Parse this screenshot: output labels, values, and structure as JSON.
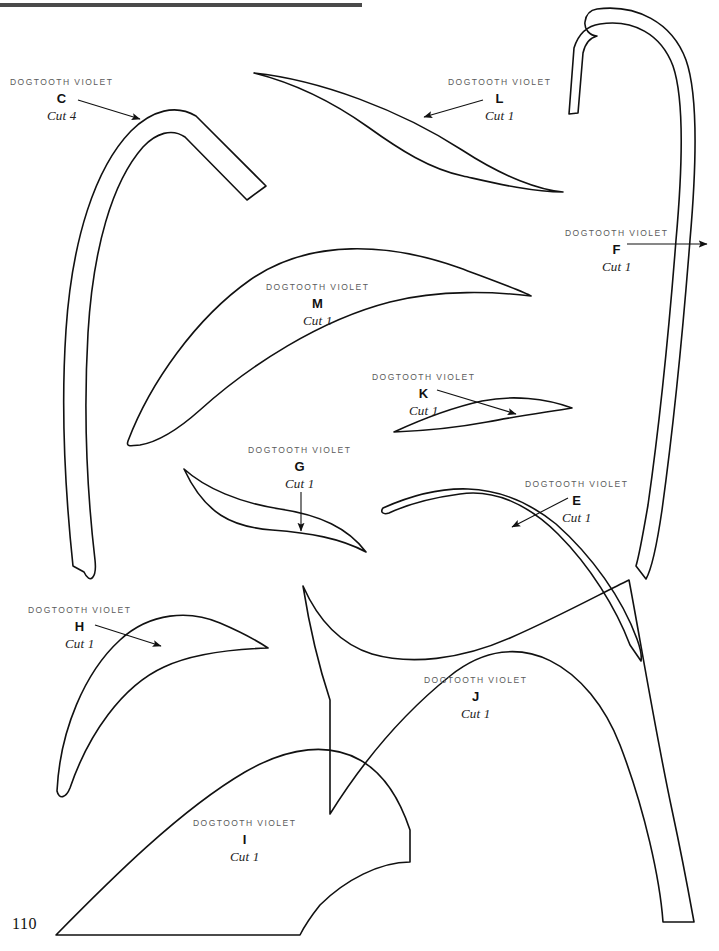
{
  "page": {
    "number": "110",
    "rule": {
      "color": "#4a4a4a"
    },
    "ink_color": "#111111",
    "title_color": "#5b5b5b"
  },
  "pieces": [
    {
      "id": "C",
      "title": "DOGTOOTH VIOLET",
      "letter": "C",
      "cut": "Cut 4",
      "label_x": 10,
      "label_y": 78,
      "arrow": {
        "from_x": 78,
        "from_y": 100,
        "to_x": 140,
        "to_y": 119
      }
    },
    {
      "id": "L",
      "title": "DOGTOOTH VIOLET",
      "letter": "L",
      "cut": "Cut 1",
      "label_x": 448,
      "label_y": 78,
      "arrow": {
        "from_x": 483,
        "from_y": 100,
        "to_x": 423,
        "to_y": 117
      }
    },
    {
      "id": "F",
      "title": "DOGTOOTH VIOLET",
      "letter": "F",
      "cut": "Cut 1",
      "label_x": 565,
      "label_y": 229,
      "arrow": {
        "from_x": 627,
        "from_y": 244,
        "to_x": 707,
        "to_y": 244
      }
    },
    {
      "id": "M",
      "title": "DOGTOOTH VIOLET",
      "letter": "M",
      "cut": "Cut 1",
      "label_x": 266,
      "label_y": 283,
      "arrow": null
    },
    {
      "id": "K",
      "title": "DOGTOOTH VIOLET",
      "letter": "K",
      "cut": "Cut 1",
      "label_x": 372,
      "label_y": 373,
      "arrow": {
        "from_x": 437,
        "from_y": 390,
        "to_x": 515,
        "to_y": 413
      }
    },
    {
      "id": "G",
      "title": "DOGTOOTH VIOLET",
      "letter": "G",
      "cut": "Cut 1",
      "label_x": 248,
      "label_y": 446,
      "arrow": {
        "from_x": 301,
        "from_y": 492,
        "to_x": 301,
        "to_y": 530
      }
    },
    {
      "id": "E",
      "title": "DOGTOOTH VIOLET",
      "letter": "E",
      "cut": "Cut 1",
      "label_x": 525,
      "label_y": 480,
      "arrow": {
        "from_x": 568,
        "from_y": 498,
        "to_x": 513,
        "to_y": 526
      }
    },
    {
      "id": "H",
      "title": "DOGTOOTH VIOLET",
      "letter": "H",
      "cut": "Cut 1",
      "label_x": 28,
      "label_y": 606,
      "arrow": {
        "from_x": 95,
        "from_y": 625,
        "to_x": 160,
        "to_y": 645
      }
    },
    {
      "id": "J",
      "title": "DOGTOOTH VIOLET",
      "letter": "J",
      "cut": "Cut 1",
      "label_x": 424,
      "label_y": 676,
      "arrow": null
    },
    {
      "id": "I",
      "title": "DOGTOOTH VIOLET",
      "letter": "I",
      "cut": "Cut 1",
      "label_x": 193,
      "label_y": 819,
      "arrow": null
    }
  ]
}
